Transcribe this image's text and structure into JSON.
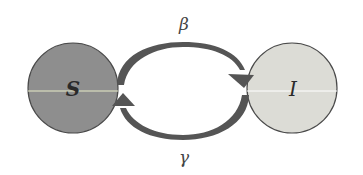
{
  "diagram": {
    "type": "SIS compartment model",
    "nodes": [
      {
        "id": "S",
        "label": "S",
        "fill": "#8e8e8e"
      },
      {
        "id": "I",
        "label": "I",
        "fill": "#dcdcd6"
      }
    ],
    "edges": [
      {
        "from": "S",
        "to": "I",
        "label": "β",
        "position": "top"
      },
      {
        "from": "I",
        "to": "S",
        "label": "γ",
        "position": "bottom"
      }
    ],
    "colors": {
      "background": "#ffffff",
      "arrow": "#555555",
      "outline": "#4a4a4a",
      "midline": "#e8ecc8"
    }
  }
}
